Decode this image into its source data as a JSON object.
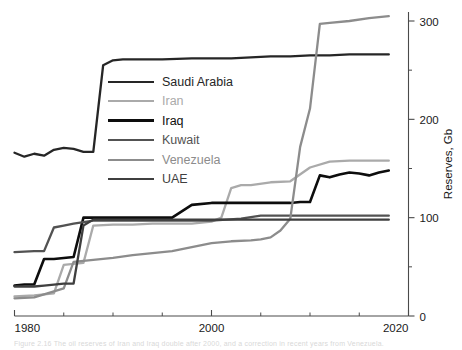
{
  "figure": {
    "caption": "Figure 2.16  The oil reserves of Iran and Iraq double after 2000, and a correction in recent years from Venezuela."
  },
  "chart_data": {
    "type": "line",
    "title": "",
    "xlabel": "",
    "ylabel": "Reserves, Gb",
    "xlim": [
      1980,
      2020
    ],
    "ylim": [
      0,
      310
    ],
    "xticks": [
      1980,
      2000,
      2020
    ],
    "xticks_minor": [
      1985,
      1990,
      1995,
      2005,
      2010,
      2015
    ],
    "yticks": [
      0,
      100,
      200,
      300
    ],
    "yticks_minor": [
      50,
      150,
      250
    ],
    "y_axis_side": "right",
    "grid": false,
    "legend_position": "upper-left-inside",
    "series": [
      {
        "name": "Saudi Arabia",
        "color": "#262626",
        "width": 2.3,
        "x": [
          1980,
          1981,
          1982,
          1983,
          1984,
          1985,
          1986,
          1987,
          1988,
          1989,
          1990,
          1991,
          1992,
          1995,
          1998,
          2000,
          2002,
          2004,
          2006,
          2008,
          2010,
          2012,
          2014,
          2016,
          2018
        ],
        "y": [
          166,
          162,
          165,
          163,
          169,
          171,
          170,
          167,
          167,
          255,
          260,
          261,
          261,
          261,
          262,
          262,
          262,
          263,
          264,
          264,
          265,
          265,
          266,
          266,
          266
        ]
      },
      {
        "name": "Iran",
        "color": "#aaaaaa",
        "width": 2.3,
        "x": [
          1980,
          1982,
          1984,
          1985,
          1986,
          1987,
          1988,
          1990,
          1992,
          1994,
          1996,
          1998,
          2000,
          2001,
          2002,
          2003,
          2004,
          2006,
          2008,
          2010,
          2012,
          2014,
          2016,
          2018
        ],
        "y": [
          20,
          21,
          23,
          52,
          53,
          54,
          92,
          93,
          93,
          94,
          94,
          94,
          96,
          100,
          130,
          133,
          133,
          136,
          137,
          151,
          157,
          158,
          158,
          158
        ]
      },
      {
        "name": "Iraq",
        "color": "#0d0d0d",
        "width": 2.6,
        "x": [
          1980,
          1981,
          1982,
          1983,
          1984,
          1985,
          1986,
          1987,
          1988,
          1989,
          1990,
          1992,
          1994,
          1996,
          1998,
          2000,
          2002,
          2004,
          2006,
          2008,
          2009,
          2010,
          2011,
          2012,
          2013,
          2014,
          2015,
          2016,
          2017,
          2018
        ],
        "y": [
          31,
          32,
          32,
          58,
          58,
          59,
          60,
          100,
          100,
          100,
          100,
          100,
          100,
          100,
          113,
          115,
          115,
          115,
          115,
          115,
          116,
          116,
          143,
          141,
          144,
          146,
          145,
          143,
          146,
          148
        ]
      },
      {
        "name": "Kuwait",
        "color": "#525252",
        "width": 2.3,
        "x": [
          1980,
          1982,
          1983,
          1984,
          1985,
          1986,
          1988,
          1990,
          1992,
          1995,
          2000,
          2003,
          2005,
          2008,
          2010,
          2014,
          2018
        ],
        "y": [
          65,
          66,
          66,
          90,
          92,
          94,
          97,
          97,
          97,
          97,
          97,
          99,
          102,
          102,
          102,
          102,
          102
        ]
      },
      {
        "name": "Venezuela",
        "color": "#8c8c8c",
        "width": 2.3,
        "x": [
          1980,
          1982,
          1984,
          1985,
          1986,
          1988,
          1990,
          1992,
          1994,
          1996,
          1998,
          2000,
          2002,
          2004,
          2005,
          2006,
          2007,
          2008,
          2009,
          2010,
          2011,
          2012,
          2014,
          2016,
          2018
        ],
        "y": [
          18,
          19,
          25,
          28,
          55,
          57,
          59,
          62,
          64,
          66,
          70,
          74,
          76,
          77,
          78,
          80,
          87,
          99,
          172,
          211,
          297,
          298,
          300,
          303,
          305
        ]
      },
      {
        "name": "UAE",
        "color": "#3f3f3f",
        "width": 2.3,
        "x": [
          1980,
          1982,
          1983,
          1984,
          1985,
          1986,
          1987,
          1988,
          1990,
          1995,
          2000,
          2005,
          2010,
          2014,
          2018
        ],
        "y": [
          30,
          30,
          31,
          32,
          33,
          33,
          92,
          98,
          98,
          98,
          98,
          98,
          98,
          98,
          98
        ]
      }
    ]
  },
  "legend": {
    "items": [
      {
        "label": "Saudi Arabia",
        "color": "#262626",
        "width": 2.6
      },
      {
        "label": "Iran",
        "color": "#aaaaaa",
        "width": 2.6
      },
      {
        "label": "Iraq",
        "color": "#0d0d0d",
        "width": 3.0
      },
      {
        "label": "Kuwait",
        "color": "#525252",
        "width": 2.6
      },
      {
        "label": "Venezuela",
        "color": "#8c8c8c",
        "width": 2.6
      },
      {
        "label": "UAE",
        "color": "#3f3f3f",
        "width": 2.6
      }
    ]
  },
  "axes": {
    "y_title": "Reserves, Gb",
    "x_tick_labels": [
      "1980",
      "2000",
      "2020"
    ],
    "y_tick_labels": [
      "0",
      "100",
      "200",
      "300"
    ]
  }
}
